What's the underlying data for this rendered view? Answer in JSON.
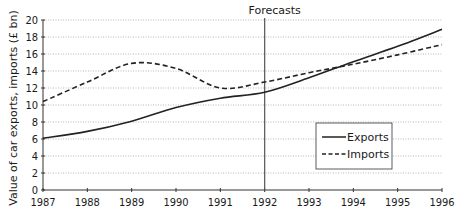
{
  "chart_data": {
    "type": "line",
    "title": "",
    "xlabel": "",
    "ylabel": "Value of car exports, imports (£ bn)",
    "x": [
      1987,
      1988,
      1989,
      1990,
      1991,
      1992,
      1993,
      1994,
      1995,
      1996
    ],
    "series": [
      {
        "name": "Exports",
        "style": "solid",
        "values": [
          6.1,
          6.9,
          8.1,
          9.7,
          10.8,
          11.5,
          13.2,
          15.1,
          16.9,
          18.9
        ]
      },
      {
        "name": "Imports",
        "style": "dashed",
        "values": [
          10.4,
          12.7,
          14.9,
          14.3,
          12.0,
          12.7,
          13.8,
          14.8,
          15.9,
          17.1
        ]
      }
    ],
    "xlim": [
      1987,
      1996
    ],
    "ylim": [
      0,
      20
    ],
    "yticks": [
      0,
      2,
      4,
      6,
      8,
      10,
      12,
      14,
      16,
      18,
      20
    ],
    "xticks": [
      1987,
      1988,
      1989,
      1990,
      1991,
      1992,
      1993,
      1994,
      1995,
      1996
    ],
    "grid": "horizontal dotted",
    "annotations": [
      {
        "text": "Forecasts",
        "x": 1992,
        "type": "vertical-line"
      }
    ],
    "legend": {
      "position": "lower right",
      "entries": [
        "Exports",
        "Imports"
      ]
    }
  },
  "labels": {
    "ylabel": "Value of car exports, imports (£ bn)",
    "forecasts": "Forecasts",
    "legend_exports": "Exports",
    "legend_imports": "Imports"
  }
}
